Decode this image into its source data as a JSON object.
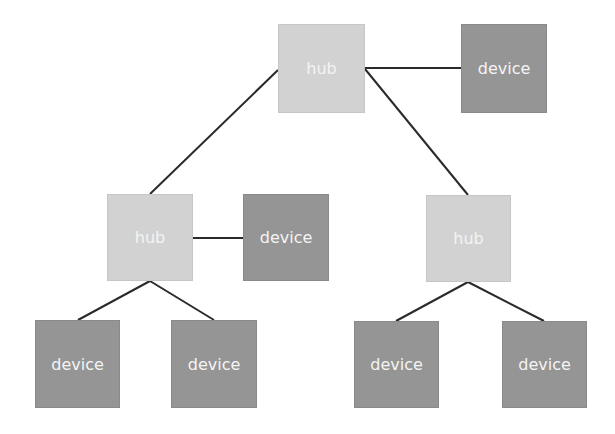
{
  "diagram": {
    "title": "",
    "colors": {
      "hub": "#d2d2d2",
      "device": "#959595",
      "text": "#f4f4f4",
      "edge": "#2a2a2a"
    },
    "nodes": [
      {
        "id": "hub_root",
        "type": "hub",
        "label": "hub",
        "x": 278,
        "y": 24,
        "w": 87,
        "h": 89
      },
      {
        "id": "dev_root",
        "type": "device",
        "label": "device",
        "x": 461,
        "y": 24,
        "w": 86,
        "h": 89
      },
      {
        "id": "hub_left",
        "type": "hub",
        "label": "hub",
        "x": 107,
        "y": 194,
        "w": 86,
        "h": 87
      },
      {
        "id": "dev_left",
        "type": "device",
        "label": "device",
        "x": 243,
        "y": 194,
        "w": 86,
        "h": 87
      },
      {
        "id": "hub_right",
        "type": "hub",
        "label": "hub",
        "x": 426,
        "y": 195,
        "w": 85,
        "h": 87
      },
      {
        "id": "dev_ll",
        "type": "device",
        "label": "device",
        "x": 35,
        "y": 320,
        "w": 85,
        "h": 88
      },
      {
        "id": "dev_lr",
        "type": "device",
        "label": "device",
        "x": 171,
        "y": 320,
        "w": 86,
        "h": 88
      },
      {
        "id": "dev_rl",
        "type": "device",
        "label": "device",
        "x": 354,
        "y": 321,
        "w": 85,
        "h": 87
      },
      {
        "id": "dev_rr",
        "type": "device",
        "label": "device",
        "x": 502,
        "y": 321,
        "w": 85,
        "h": 87
      }
    ],
    "edges": [
      {
        "from": "hub_root",
        "to": "dev_root",
        "x1": 365,
        "y1": 68,
        "x2": 461,
        "y2": 68
      },
      {
        "from": "hub_root",
        "to": "hub_left",
        "x1": 278,
        "y1": 70,
        "x2": 150,
        "y2": 194
      },
      {
        "from": "hub_root",
        "to": "hub_right",
        "x1": 365,
        "y1": 69,
        "x2": 468,
        "y2": 195
      },
      {
        "from": "hub_left",
        "to": "dev_left",
        "x1": 193,
        "y1": 238,
        "x2": 243,
        "y2": 238
      },
      {
        "from": "hub_left",
        "to": "dev_ll",
        "x1": 150,
        "y1": 281,
        "x2": 78,
        "y2": 320
      },
      {
        "from": "hub_left",
        "to": "dev_lr",
        "x1": 150,
        "y1": 281,
        "x2": 214,
        "y2": 320
      },
      {
        "from": "hub_right",
        "to": "dev_rl",
        "x1": 468,
        "y1": 282,
        "x2": 396,
        "y2": 321
      },
      {
        "from": "hub_right",
        "to": "dev_rr",
        "x1": 468,
        "y1": 282,
        "x2": 544,
        "y2": 321
      }
    ]
  }
}
